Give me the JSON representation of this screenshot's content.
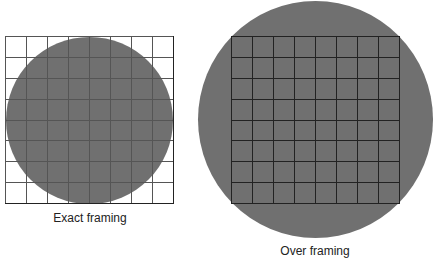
{
  "panels": [
    {
      "caption": "Exact framing",
      "circle_color": "#707070",
      "grid_rows": 8,
      "grid_cols": 8
    },
    {
      "caption": "Over framing",
      "circle_color": "#707070",
      "grid_rows": 8,
      "grid_cols": 8
    }
  ],
  "colors": {
    "circle": "#707070",
    "grid_line": "#222222",
    "background": "#ffffff"
  }
}
